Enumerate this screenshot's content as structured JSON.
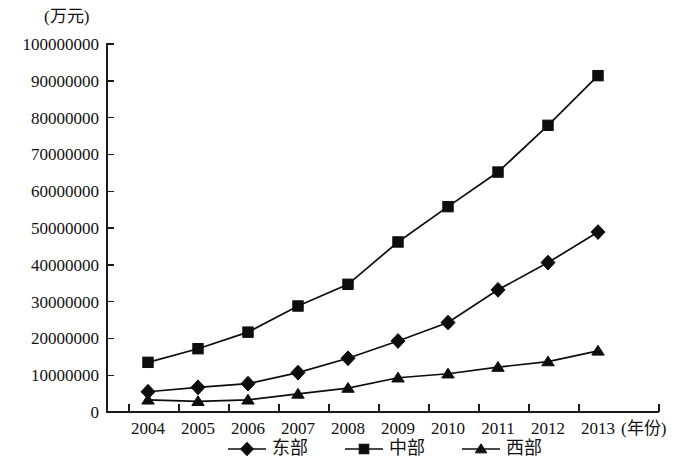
{
  "chart_data": {
    "type": "line",
    "title": "",
    "subtitle": "",
    "xlabel": "(年份)",
    "ylabel": "(万元)",
    "categories": [
      "2004",
      "2005",
      "2006",
      "2007",
      "2008",
      "2009",
      "2010",
      "2011",
      "2012",
      "2013"
    ],
    "x": [
      2004,
      2005,
      2006,
      2007,
      2008,
      2009,
      2010,
      2011,
      2012,
      2013
    ],
    "ylim": [
      0,
      100000000
    ],
    "ytick_step": 10000000,
    "ytick_labels": [
      "0",
      "10000000",
      "20000000",
      "30000000",
      "40000000",
      "50000000",
      "60000000",
      "70000000",
      "80000000",
      "90000000",
      "100000000"
    ],
    "ytick_values": [
      0,
      10000000,
      20000000,
      30000000,
      40000000,
      50000000,
      60000000,
      70000000,
      80000000,
      90000000,
      100000000
    ],
    "grid": false,
    "legend_position": "bottom",
    "series": [
      {
        "name": "东部",
        "marker": "diamond",
        "color": "#0d0d0d",
        "values": [
          5500000,
          6700000,
          7700000,
          10700000,
          14600000,
          19300000,
          24300000,
          33200000,
          40600000,
          48900000
        ]
      },
      {
        "name": "中部",
        "marker": "square",
        "color": "#0d0d0d",
        "values": [
          13500000,
          17200000,
          21700000,
          28800000,
          34700000,
          46200000,
          55800000,
          65200000,
          77900000,
          91400000
        ]
      },
      {
        "name": "西部",
        "marker": "triangle",
        "color": "#0d0d0d",
        "values": [
          3300000,
          2900000,
          3300000,
          4900000,
          6500000,
          9300000,
          10400000,
          12200000,
          13700000,
          16600000
        ]
      }
    ]
  },
  "legend": {
    "items": [
      {
        "label": "东部",
        "marker": "diamond"
      },
      {
        "label": "中部",
        "marker": "square"
      },
      {
        "label": "西部",
        "marker": "triangle"
      }
    ]
  }
}
